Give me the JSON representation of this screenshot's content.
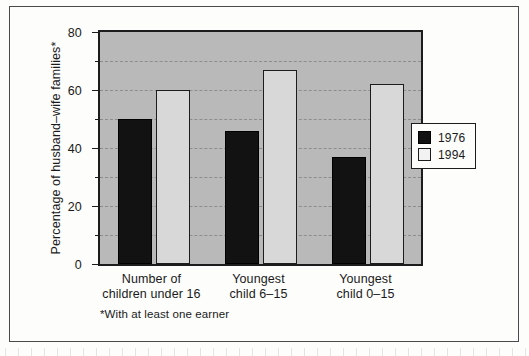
{
  "chart_data": {
    "type": "bar",
    "title": "",
    "xlabel": "",
    "ylabel": "Percentage of husband–wife families*",
    "ylim": [
      0,
      80
    ],
    "yticks": [
      0,
      20,
      40,
      60,
      80
    ],
    "ytick_labels": [
      "0",
      "20",
      "40",
      "60",
      "80"
    ],
    "minor_gridlines": [
      10,
      30,
      50,
      70
    ],
    "grid": true,
    "legend_position": "right-middle",
    "categories": [
      "Number of children under 16",
      "Youngest child 6–15",
      "Youngest child 0–15"
    ],
    "category_lines": [
      [
        "Number of",
        "children under 16"
      ],
      [
        "Youngest",
        "child 6–15"
      ],
      [
        "Youngest",
        "child 0–15"
      ]
    ],
    "series": [
      {
        "name": "1976",
        "color": "#121212",
        "values": [
          50,
          46,
          37
        ]
      },
      {
        "name": "1994",
        "color": "#d8d8d8",
        "values": [
          60,
          67,
          62
        ]
      }
    ],
    "footnote": "*With at least one earner"
  },
  "legend": {
    "entries": [
      {
        "label": "1976",
        "swatch": "black-square"
      },
      {
        "label": "1994",
        "swatch": "white-square"
      }
    ]
  },
  "colors": {
    "plot_background": "#b9b9b9",
    "page_background": "#fdfdfc",
    "axis": "#1c1c1c",
    "gridline": "#8d8d8d",
    "series_1976": "#121212",
    "series_1994": "#d8d8d8"
  }
}
